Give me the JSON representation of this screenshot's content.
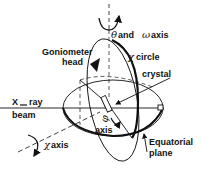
{
  "diagram": {
    "labels": {
      "theta_omega_symbol": "θ",
      "theta_omega_text_and": "and",
      "theta_omega_omega": "ω",
      "theta_omega_text_axis": "axis",
      "goniometer_line1": "Goniometer",
      "goniometer_line2": "head",
      "chi_circle_symbol": "χ",
      "chi_circle_text": "circle",
      "crystal": "crystal",
      "xray_line1": "X",
      "xray_line1_rest": "ray",
      "xray_line2": "beam",
      "phi_symbol": "φ",
      "phi_axis": "axis",
      "chi_axis_symbol": "χ",
      "chi_axis_text": "axis",
      "equatorial_line1": "Equatorial",
      "equatorial_line2": "plane"
    },
    "colors": {
      "ink": "#111111",
      "background": "#ffffff"
    }
  }
}
